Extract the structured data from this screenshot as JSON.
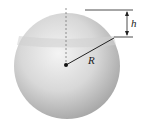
{
  "diagram": {
    "labels": {
      "radius": "R",
      "cap_height": "h"
    },
    "colors": {
      "sphere_light": "#f2f2f2",
      "sphere_dark": "#a8a8a8",
      "lines": "#222222"
    }
  }
}
